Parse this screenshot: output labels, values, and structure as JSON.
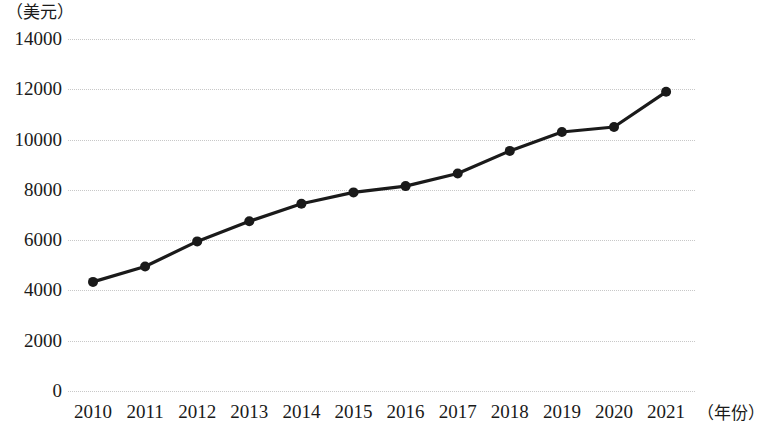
{
  "chart_data": {
    "type": "line",
    "title": "",
    "subtitle": "",
    "xlabel": "（年份）",
    "ylabel": "（美元）",
    "categories": [
      "2010",
      "2011",
      "2012",
      "2013",
      "2014",
      "2015",
      "2016",
      "2017",
      "2018",
      "2019",
      "2020",
      "2021"
    ],
    "series": [
      {
        "name": "人均GDP",
        "values": [
          4340,
          4950,
          5950,
          6750,
          7450,
          7900,
          8150,
          8650,
          9550,
          10300,
          10500,
          11900
        ]
      }
    ],
    "ylim": [
      0,
      14000
    ],
    "ytick_labels": [
      "14000",
      "12000",
      "10000",
      "8000",
      "6000",
      "4000",
      "2000",
      "0"
    ],
    "ytick_values": [
      14000,
      12000,
      10000,
      8000,
      6000,
      4000,
      2000,
      0
    ],
    "grid": true,
    "legend": "none",
    "marker": "filled-circle",
    "line_color": "#1a1a1a",
    "grid_color": "#c8c8c8"
  }
}
